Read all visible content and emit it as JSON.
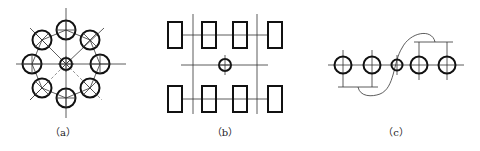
{
  "figures": [
    {
      "id": "a",
      "label": "（a）",
      "label_x": 63,
      "description": "Circular arrangement of 8 holes around a central hole with diagonal lines"
    },
    {
      "id": "b",
      "label": "（b）",
      "label_x": 225,
      "description": "Two rows of 4 rectangles around a central small circle"
    },
    {
      "id": "c",
      "label": "（c）",
      "label_x": 396,
      "description": "Row of 5 circles with brackets above and below joined by S-curve"
    }
  ],
  "colors": {
    "stroke": "#111111",
    "background": "#ffffff"
  }
}
